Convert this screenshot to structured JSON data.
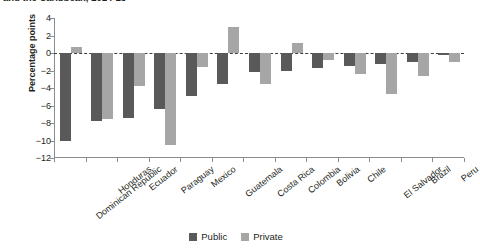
{
  "title": {
    "text": "and the Caribbean, 2014-15",
    "clipped": true
  },
  "axes": {
    "ylabel": "Percentage points",
    "xlabel": "",
    "yticks": [
      "4",
      "2",
      "0",
      "-2",
      "-4",
      "-6",
      "-8",
      "-10",
      "-12"
    ]
  },
  "legend": {
    "position": "bottom-center",
    "items": [
      {
        "label": "Public",
        "color": "#595959"
      },
      {
        "label": "Private",
        "color": "#a6a6a6"
      }
    ]
  },
  "colors": {
    "public": "#595959",
    "private": "#a6a6a6",
    "axis": "#8c8c8c",
    "text": "#231f20",
    "zeroline": "#3f3f3f"
  },
  "chart_data": {
    "type": "bar",
    "title": "and the Caribbean, 2014-15",
    "xlabel": "",
    "ylabel": "Percentage points",
    "ylim": [
      -12,
      4
    ],
    "ytick_step": 2,
    "grid": false,
    "legend_position": "bottom-center",
    "zero_reference_line": 0,
    "categories": [
      "Dominican Republic",
      "Honduras",
      "Ecuador",
      "Paraguay",
      "Mexico",
      "Guatemala",
      "Costa Rica",
      "Colombia",
      "Bolivia",
      "Chile",
      "El Salvador",
      "Brazil",
      "Peru"
    ],
    "series": [
      {
        "name": "Public",
        "color": "#595959",
        "values": [
          -10.0,
          -7.8,
          -7.4,
          -6.4,
          -4.9,
          -3.5,
          -2.2,
          -2.0,
          -1.7,
          -1.5,
          -1.2,
          -1.0,
          -0.2
        ]
      },
      {
        "name": "Private",
        "color": "#a6a6a6",
        "values": [
          0.7,
          -7.5,
          -3.8,
          -10.5,
          -1.6,
          3.0,
          -3.5,
          1.1,
          -0.8,
          -2.4,
          -4.7,
          -2.6,
          -1.0
        ]
      }
    ]
  }
}
